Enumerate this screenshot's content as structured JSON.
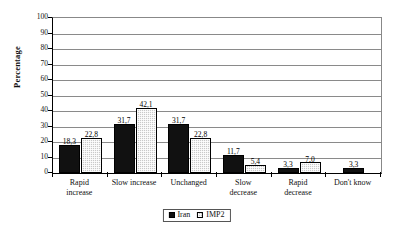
{
  "chart_data": {
    "type": "bar",
    "title": "",
    "xlabel": "",
    "ylabel": "Percentage",
    "ylim": [
      0,
      100
    ],
    "ytick_step": 10,
    "yticks": [
      0,
      10,
      20,
      30,
      40,
      50,
      60,
      70,
      80,
      90,
      100
    ],
    "grid": true,
    "legend_position": "bottom-center",
    "decimal_separator": ",",
    "categories": [
      "Rapid increase",
      "Slow increase",
      "Unchanged",
      "Slow decrease",
      "Rapid decrease",
      "Don't know"
    ],
    "series": [
      {
        "name": "Iran",
        "color": "#111111",
        "values": [
          18.3,
          31.7,
          31.7,
          11.7,
          3.3,
          3.3
        ],
        "labels": [
          "18,3",
          "31,7",
          "31,7",
          "11,7",
          "3,3",
          "3,3"
        ]
      },
      {
        "name": "IMP2",
        "color": "#c9c9c9",
        "values": [
          22.8,
          42.1,
          22.8,
          5.4,
          7.0,
          null
        ],
        "labels": [
          "22,8",
          "42,1",
          "22,8",
          "5,4",
          "7,0",
          ""
        ]
      }
    ]
  },
  "axis": {
    "y_title": "Percentage",
    "tick_labels": [
      "100",
      "90",
      "80",
      "70",
      "60",
      "50",
      "40",
      "30",
      "20",
      "10",
      "0"
    ]
  },
  "legend": {
    "items": [
      {
        "label": "Iran"
      },
      {
        "label": "IMP2"
      }
    ]
  },
  "category_lines": [
    [
      "Rapid",
      "increase"
    ],
    [
      "Slow increase",
      ""
    ],
    [
      "Unchanged",
      ""
    ],
    [
      "Slow",
      "decrease"
    ],
    [
      "Rapid",
      "decrease"
    ],
    [
      "Don't know",
      ""
    ]
  ]
}
